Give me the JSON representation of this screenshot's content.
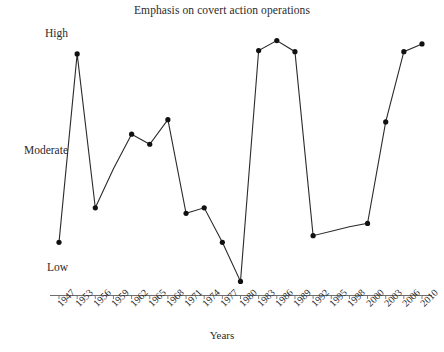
{
  "chart_data": {
    "type": "line",
    "title": "Emphasis on covert action operations",
    "xlabel": "Years",
    "ylabel": "",
    "categories": [
      "1947",
      "1953",
      "1956",
      "1959",
      "1962",
      "1965",
      "1968",
      "1971",
      "1974",
      "1977",
      "1980",
      "1983",
      "1986",
      "1989",
      "1992",
      "1995",
      "1998",
      "2000",
      "2003",
      "2006",
      "2010"
    ],
    "ytick_labels": [
      "High",
      "Moderate",
      "Low"
    ],
    "ytick_values": [
      3,
      2,
      1
    ],
    "ylim": [
      0.78,
      3.12
    ],
    "grid": false,
    "legend": null,
    "series": [
      {
        "name": "Emphasis on covert action operations",
        "values": [
          1.23,
          2.92,
          1.54,
          1.89,
          2.2,
          2.11,
          2.33,
          1.49,
          1.54,
          1.23,
          0.88,
          2.95,
          3.04,
          2.94,
          1.29,
          1.33,
          1.37,
          1.4,
          2.31,
          2.94,
          3.01
        ],
        "value_labels": [
          "Low-ish",
          "High",
          "Below moderate",
          "",
          "Moderate+",
          "Moderate",
          "Moderate+",
          "Low+",
          "Low+",
          "Low-ish",
          "Below low",
          "High",
          "High",
          "High",
          "Low",
          "Low",
          "Low",
          "Low",
          "Moderate+",
          "High",
          "High"
        ],
        "marker_at": [
          true,
          true,
          true,
          false,
          true,
          true,
          true,
          true,
          true,
          true,
          true,
          true,
          true,
          true,
          true,
          false,
          false,
          true,
          true,
          true,
          true
        ],
        "marker": "circle",
        "color": "#2b2b2b"
      }
    ]
  }
}
